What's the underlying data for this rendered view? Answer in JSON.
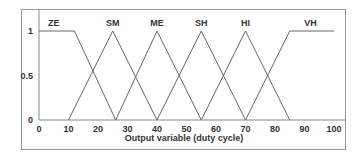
{
  "chart_data": {
    "type": "line",
    "title": "",
    "xlabel": "Output variable (duty cycle)",
    "ylabel": "",
    "xlim": [
      0,
      100
    ],
    "ylim": [
      0,
      1
    ],
    "x_ticks": [
      "0",
      "10",
      "20",
      "30",
      "40",
      "50",
      "60",
      "70",
      "80",
      "90",
      "100"
    ],
    "y_ticks": [
      "0",
      "0.5",
      "1"
    ],
    "grid": false,
    "legend": "none",
    "series": [
      {
        "name": "ZE",
        "x": [
          0,
          12,
          26
        ],
        "y": [
          1,
          1,
          0
        ]
      },
      {
        "name": "SM",
        "x": [
          10,
          25,
          40
        ],
        "y": [
          0,
          1,
          0
        ]
      },
      {
        "name": "ME",
        "x": [
          26,
          40,
          55
        ],
        "y": [
          0,
          1,
          0
        ]
      },
      {
        "name": "SH",
        "x": [
          40,
          55,
          70
        ],
        "y": [
          0,
          1,
          0
        ]
      },
      {
        "name": "HI",
        "x": [
          55,
          70,
          85
        ],
        "y": [
          0,
          1,
          0
        ]
      },
      {
        "name": "VH",
        "x": [
          70,
          85,
          100
        ],
        "y": [
          0,
          1,
          1
        ]
      }
    ],
    "label_positions": {
      "ZE": 5,
      "SM": 25,
      "ME": 40,
      "SH": 55,
      "HI": 70,
      "VH": 92
    }
  }
}
